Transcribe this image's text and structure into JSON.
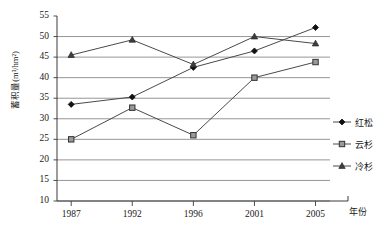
{
  "chart_data": {
    "type": "line",
    "title": "",
    "xlabel": "年份",
    "ylabel": "蓄积量(m³/hm²)",
    "categories": [
      "1987",
      "1992",
      "1996",
      "2001",
      "2005"
    ],
    "ylim": [
      10,
      55
    ],
    "ytick_step": 5,
    "yticks": [
      "55",
      "50",
      "45",
      "40",
      "35",
      "30",
      "25",
      "20",
      "15",
      "10"
    ],
    "grid": true,
    "grid_axis": "y",
    "legend_position": "right",
    "series": [
      {
        "name": "红松",
        "marker": "diamond",
        "color": "#1a1a1a",
        "values": [
          33.5,
          35.3,
          42.5,
          46.5,
          52.2
        ]
      },
      {
        "name": "云杉",
        "marker": "square",
        "color": "#555555",
        "values": [
          25.0,
          32.7,
          26.0,
          40.0,
          43.8
        ]
      },
      {
        "name": "冷杉",
        "marker": "triangle",
        "color": "#444444",
        "values": [
          45.5,
          49.2,
          43.2,
          50.0,
          48.3
        ]
      }
    ]
  },
  "axes": {
    "y_axis_label": "蓄积量(m³/hm²)",
    "x_axis_label": "年份"
  },
  "legend": {
    "items": [
      {
        "label": "红松",
        "marker": "diamond"
      },
      {
        "label": "云杉",
        "marker": "square"
      },
      {
        "label": "冷杉",
        "marker": "triangle"
      }
    ]
  }
}
